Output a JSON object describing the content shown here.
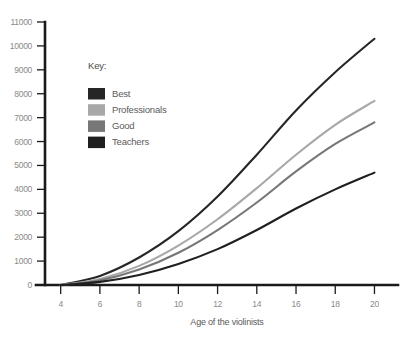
{
  "chart_data": {
    "type": "line",
    "title": "",
    "xlabel": "Age of the violinists",
    "ylabel": "",
    "xlim": [
      3.2,
      21.2
    ],
    "ylim": [
      0,
      11000
    ],
    "grid": false,
    "legend_position": "inside-upper-left",
    "legend_title": "Key:",
    "x_ticks": [
      4,
      6,
      8,
      10,
      12,
      14,
      16,
      18,
      20
    ],
    "y_ticks": [
      0,
      1000,
      2000,
      3000,
      4000,
      5000,
      6000,
      7000,
      8000,
      9000,
      10000,
      11000
    ],
    "x": [
      4,
      6,
      8,
      10,
      12,
      14,
      16,
      18,
      20
    ],
    "series": [
      {
        "name": "Best",
        "color": "#262626",
        "values": [
          0,
          380,
          1150,
          2250,
          3700,
          5450,
          7300,
          8900,
          10300
        ]
      },
      {
        "name": "Professionals",
        "color": "#a8a8a8",
        "values": [
          0,
          250,
          800,
          1650,
          2750,
          4050,
          5450,
          6700,
          7700
        ]
      },
      {
        "name": "Good",
        "color": "#777777",
        "values": [
          0,
          200,
          650,
          1350,
          2300,
          3450,
          4750,
          5900,
          6800
        ]
      },
      {
        "name": "Teachers",
        "color": "#1f1f1f",
        "values": [
          0,
          130,
          420,
          880,
          1500,
          2300,
          3200,
          4000,
          4700
        ]
      }
    ]
  }
}
